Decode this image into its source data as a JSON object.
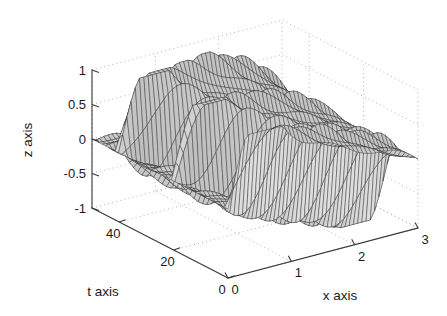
{
  "figure": {
    "title": "",
    "background_color": "#ffffff",
    "width": 447,
    "height": 316
  },
  "axes": {
    "z": {
      "label": "z axis",
      "ticks": [
        "1",
        "0.5",
        "0",
        "-0.5",
        "-1"
      ],
      "tick_values": [
        1,
        0.5,
        0,
        -0.5,
        -1
      ],
      "range": [
        -1,
        1
      ]
    },
    "t": {
      "label": "t axis",
      "ticks": [
        "40",
        "20",
        "0"
      ],
      "tick_values": [
        40,
        20,
        0
      ],
      "range": [
        0,
        50
      ]
    },
    "x": {
      "label": "x axis",
      "ticks": [
        "0",
        "1",
        "2",
        "3"
      ],
      "tick_values": [
        0,
        1,
        2,
        3
      ],
      "range": [
        0,
        3
      ]
    }
  },
  "style": {
    "axis_color": "#3a3a3a",
    "text_color": "#1a1a1a",
    "grid_color": "#b4b4b4",
    "mesh_color": "#2a2a2a",
    "mesh_fill_light": "#e8e8e8",
    "mesh_fill_dark": "#8a8a8a"
  },
  "chart_data": {
    "type": "surface",
    "title": "",
    "xlabel": "x axis",
    "ylabel": "t axis",
    "zlabel": "z axis",
    "xlim": [
      0,
      3
    ],
    "ylim": [
      0,
      50
    ],
    "zlim": [
      -1,
      1
    ],
    "grid": true,
    "legend": "none",
    "projection": {
      "azimuth_deg": -37.5,
      "elevation_deg": 30,
      "type": "matlab-default-3d"
    },
    "surface_model": {
      "formula": "z(x,t) = sum_k a_k * sin(k*pi*x/3) * cos(w_k*t)",
      "x_samples": 46,
      "t_samples": 42,
      "modes": [
        {
          "k": 1,
          "amplitude": 0.62,
          "omega": 0.3
        },
        {
          "k": 2,
          "amplitude": 0.34,
          "omega": 0.62
        },
        {
          "k": 3,
          "amplitude": 0.24,
          "omega": 0.93
        },
        {
          "k": 4,
          "amplitude": 0.13,
          "omega": 1.24
        },
        {
          "k": 5,
          "amplitude": 0.09,
          "omega": 1.55
        }
      ]
    },
    "z_observed_min": -1.0,
    "z_observed_max": 1.0
  }
}
